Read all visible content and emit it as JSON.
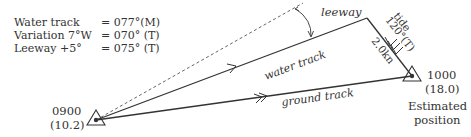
{
  "calculation": [
    {
      "label": "Water track",
      "value": "= 077°(M)"
    },
    {
      "label": "Variation 7°W",
      "value": "= 070° (T)"
    },
    {
      "label": "Leeway +5°",
      "value": "= 075° (T)"
    }
  ],
  "labels": {
    "leeway": "leeway",
    "water_track": "water track",
    "ground_track": "ground track",
    "tide_name": "tide",
    "tide_direction": "120°(T)",
    "tide_distance": "2.0kn"
  },
  "start_fix": {
    "time": "0900",
    "log": "(10.2)"
  },
  "end_fix": {
    "time": "1000",
    "log": "(18.0)",
    "caption_line1": "Estimated",
    "caption_line2": "position"
  },
  "colors": {
    "line": "#333333",
    "dashed": "#555555"
  }
}
